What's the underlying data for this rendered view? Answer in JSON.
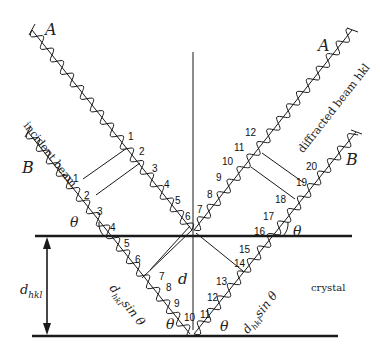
{
  "figure": {
    "beams": {
      "incident_label": "incident beam",
      "diffracted_label": "diffracted beam hkl",
      "ray_a": "A",
      "ray_b": "B"
    },
    "labels": {
      "d_hkl": "d",
      "d_hkl_sub": "hkl",
      "d_center": "d",
      "crystal": "crystal",
      "theta": "θ",
      "path_left": "d",
      "path_left_sub": "hkl",
      "path_left_tail": "sin θ",
      "path_right": "d",
      "path_right_sub": "hkl",
      "path_right_tail": "sin θ"
    },
    "wave_counts": {
      "ray_a_incident": [
        "1",
        "2",
        "3",
        "4",
        "5",
        "6"
      ],
      "ray_a_diffracted": [
        "7",
        "8",
        "9",
        "10",
        "11",
        "12"
      ],
      "ray_b_incident": [
        "1",
        "2",
        "3",
        "4",
        "5",
        "6",
        "7",
        "8",
        "9",
        "10"
      ],
      "ray_b_diffracted": [
        "11",
        "12",
        "13",
        "14",
        "15",
        "16",
        "17",
        "18",
        "19",
        "20"
      ]
    },
    "colors": {
      "ink": "#1a1a1a",
      "background": "#ffffff"
    }
  }
}
